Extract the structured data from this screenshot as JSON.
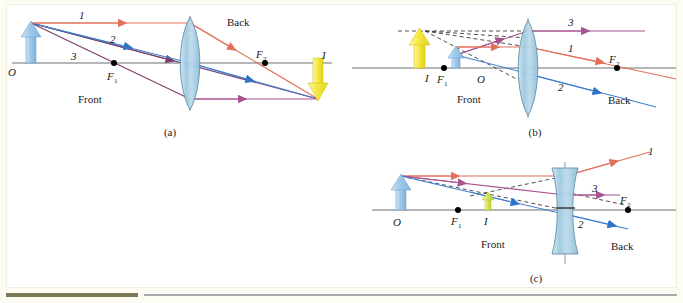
{
  "figure": {
    "background_color": "#ffffff",
    "frame_color": "#f2eedd",
    "page_color": "#fdfcf3"
  },
  "colors": {
    "ray1": "#e2705a",
    "ray2": "#3f7fd0",
    "ray3": "#a8538f",
    "object_arrow": "#9fc6e8",
    "image_arrow_real": "#f2e53a",
    "image_arrow_virtual": "#f2e53a",
    "image_arrow_small": "#d8e05a",
    "lens_fill": "#aed3e6",
    "axis": "#6e6e6e",
    "dashed": "#3a3a3a"
  },
  "panels": [
    {
      "id": "a",
      "caption": "(a)",
      "lens_type": "converging",
      "labels": {
        "object": "O",
        "image": "I",
        "front_focus": "F",
        "front_focus_sub": "1",
        "back_focus": "F",
        "back_focus_sub": "2",
        "front": "Front",
        "back": "Back",
        "ray1": "1",
        "ray2": "2",
        "ray3": "3"
      },
      "image_nature": "real inverted",
      "object_arrow_direction": "up",
      "image_arrow_direction": "down"
    },
    {
      "id": "b",
      "caption": "(b)",
      "lens_type": "converging",
      "labels": {
        "object": "O",
        "image": "I",
        "front_focus": "F",
        "front_focus_sub": "1",
        "back_focus": "F",
        "back_focus_sub": "2",
        "front": "Front",
        "back": "Back",
        "ray1": "1",
        "ray2": "2",
        "ray3": "3"
      },
      "image_nature": "virtual upright magnified",
      "object_arrow_direction": "up",
      "image_arrow_direction": "up"
    },
    {
      "id": "c",
      "caption": "(c)",
      "lens_type": "diverging",
      "labels": {
        "object": "O",
        "image": "I",
        "front_focus": "F",
        "front_focus_sub": "1",
        "back_focus": "F",
        "back_focus_sub": "2",
        "front": "Front",
        "back": "Back",
        "ray1": "1",
        "ray2": "2",
        "ray3": "3"
      },
      "image_nature": "virtual upright reduced",
      "object_arrow_direction": "up",
      "image_arrow_direction": "up"
    }
  ]
}
